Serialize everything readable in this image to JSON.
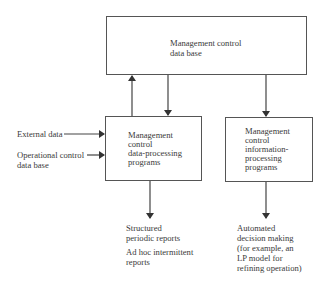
{
  "diagram": {
    "nodes": {
      "db": {
        "label_lines": [
          "Management control",
          "data base"
        ]
      },
      "dp": {
        "label_lines": [
          "Management",
          "control",
          "data-processing",
          "programs"
        ]
      },
      "ip": {
        "label_lines": [
          "Management",
          "control",
          "information-",
          "processing",
          "programs"
        ]
      }
    },
    "inputs": {
      "external": {
        "label_lines": [
          "External data"
        ]
      },
      "operational": {
        "label_lines": [
          "Operational control",
          "data base"
        ]
      }
    },
    "outputs": {
      "reports1": {
        "label_lines": [
          "Structured",
          "periodic reports"
        ]
      },
      "reports2": {
        "label_lines": [
          "Ad hoc intermittent",
          "reports"
        ]
      },
      "automated": {
        "label_lines": [
          "Automated",
          "decision making",
          "(for example, an",
          "LP model for",
          "refining operation)"
        ]
      }
    },
    "edges": [
      {
        "from": "dp",
        "to": "db"
      },
      {
        "from": "db",
        "to": "dp"
      },
      {
        "from": "db",
        "to": "ip"
      },
      {
        "from": "external",
        "to": "dp"
      },
      {
        "from": "operational",
        "to": "dp"
      },
      {
        "from": "dp",
        "to": "reports"
      },
      {
        "from": "ip",
        "to": "automated"
      }
    ]
  }
}
